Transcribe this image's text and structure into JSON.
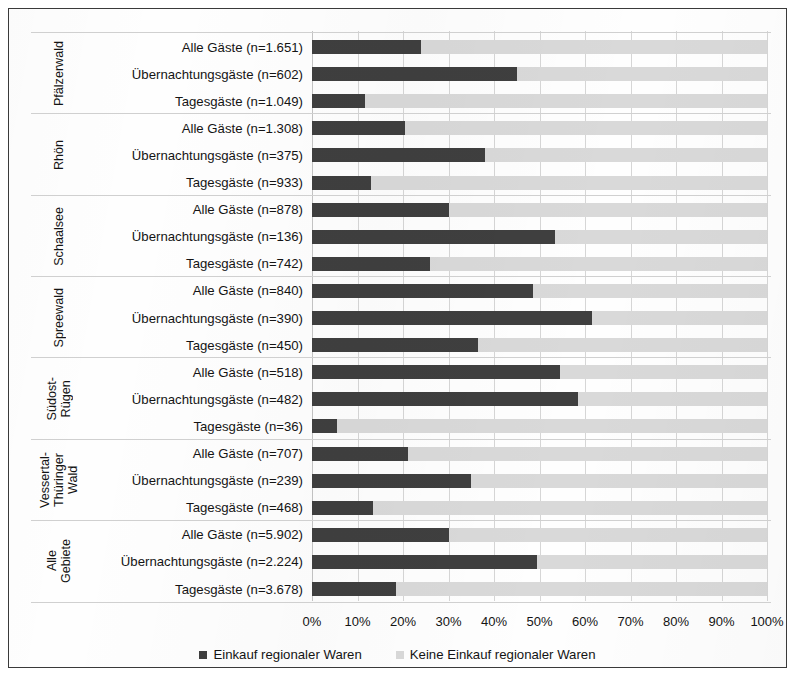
{
  "chart_data": {
    "type": "bar",
    "subtype": "stacked-horizontal-100",
    "title": "",
    "xlabel": "",
    "ylabel": "",
    "xlim": [
      0,
      100
    ],
    "xticks": [
      "0%",
      "10%",
      "20%",
      "30%",
      "40%",
      "50%",
      "60%",
      "70%",
      "80%",
      "90%",
      "100%"
    ],
    "grid": true,
    "legend_position": "bottom",
    "colors": {
      "einkauf": "#3f3f3f",
      "kein_einkauf": "#d9d9d9",
      "frame": "#3a3a3a",
      "gridline": "#d6d6d6"
    },
    "series": [
      {
        "name": "Einkauf regionaler Waren",
        "color": "#3f3f3f"
      },
      {
        "name": "Keine Einkauf regionaler Waren",
        "color": "#d9d9d9"
      }
    ],
    "groups": [
      {
        "label": "Pfälzerwald",
        "rows": [
          {
            "category": "Alle Gäste (n=1.651)",
            "einkauf": 24.0,
            "kein_einkauf": 76.0
          },
          {
            "category": "Übernachtungsgäste (n=602)",
            "einkauf": 45.0,
            "kein_einkauf": 55.0
          },
          {
            "category": "Tagesgäste (n=1.049)",
            "einkauf": 11.7,
            "kein_einkauf": 88.3
          }
        ]
      },
      {
        "label": "Rhön",
        "rows": [
          {
            "category": "Alle Gäste (n=1.308)",
            "einkauf": 20.5,
            "kein_einkauf": 79.5
          },
          {
            "category": "Übernachtungsgäste (n=375)",
            "einkauf": 38.0,
            "kein_einkauf": 62.0
          },
          {
            "category": "Tagesgäste (n=933)",
            "einkauf": 13.0,
            "kein_einkauf": 87.0
          }
        ]
      },
      {
        "label": "Schaalsee",
        "rows": [
          {
            "category": "Alle Gäste (n=878)",
            "einkauf": 30.0,
            "kein_einkauf": 70.0
          },
          {
            "category": "Übernachtungsgäste (n=136)",
            "einkauf": 53.5,
            "kein_einkauf": 46.5
          },
          {
            "category": "Tagesgäste (n=742)",
            "einkauf": 26.0,
            "kein_einkauf": 74.0
          }
        ]
      },
      {
        "label": "Spreewald",
        "rows": [
          {
            "category": "Alle Gäste (n=840)",
            "einkauf": 48.5,
            "kein_einkauf": 51.5
          },
          {
            "category": "Übernachtungsgäste (n=390)",
            "einkauf": 61.5,
            "kein_einkauf": 38.5
          },
          {
            "category": "Tagesgäste (n=450)",
            "einkauf": 36.5,
            "kein_einkauf": 63.5
          }
        ]
      },
      {
        "label": "Südost-\nRügen",
        "rows": [
          {
            "category": "Alle Gäste (n=518)",
            "einkauf": 54.5,
            "kein_einkauf": 45.5
          },
          {
            "category": "Übernachtungsgäste (n=482)",
            "einkauf": 58.5,
            "kein_einkauf": 41.5
          },
          {
            "category": "Tagesgäste (n=36)",
            "einkauf": 5.5,
            "kein_einkauf": 94.5
          }
        ]
      },
      {
        "label": "Vessertal-\nThüringer\nWald",
        "rows": [
          {
            "category": "Alle Gäste (n=707)",
            "einkauf": 21.0,
            "kein_einkauf": 79.0
          },
          {
            "category": "Übernachtungsgäste (n=239)",
            "einkauf": 35.0,
            "kein_einkauf": 65.0
          },
          {
            "category": "Tagesgäste (n=468)",
            "einkauf": 13.5,
            "kein_einkauf": 86.5
          }
        ]
      },
      {
        "label": "Alle\nGebiete",
        "rows": [
          {
            "category": "Alle Gäste (n=5.902)",
            "einkauf": 30.0,
            "kein_einkauf": 70.0
          },
          {
            "category": "Übernachtungsgäste (n=2.224)",
            "einkauf": 49.5,
            "kein_einkauf": 50.5
          },
          {
            "category": "Tagesgäste (n=3.678)",
            "einkauf": 18.5,
            "kein_einkauf": 81.5
          }
        ]
      }
    ]
  },
  "legend": {
    "items": [
      {
        "label": "Einkauf regionaler Waren",
        "swatch": "dark"
      },
      {
        "label": "Keine Einkauf regionaler Waren",
        "swatch": "light"
      }
    ]
  }
}
